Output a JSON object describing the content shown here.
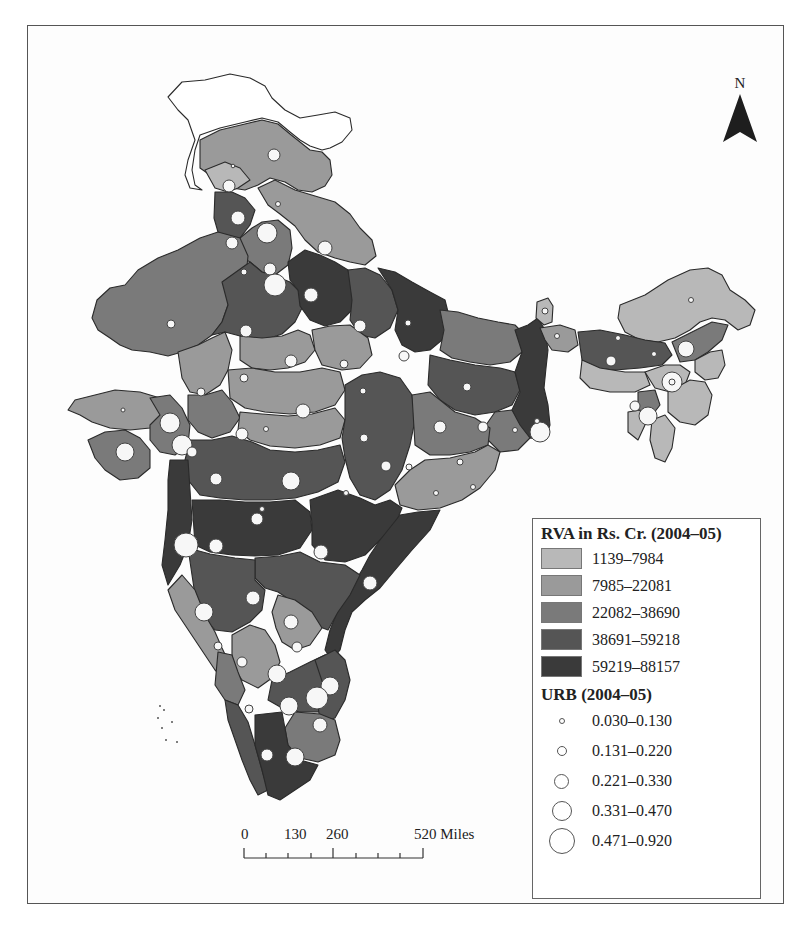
{
  "map": {
    "type": "choropleth-with-proportional-symbols",
    "region": "India (states and regions)",
    "north_arrow": {
      "label": "N",
      "icon": "north-arrow-icon"
    },
    "scale_bar": {
      "labels": [
        "0",
        "130",
        "260",
        "520 Miles"
      ],
      "ticks_miles": [
        0,
        65,
        130,
        195,
        260,
        325,
        390,
        455,
        520
      ],
      "unit": "Miles"
    },
    "legend": {
      "choropleth": {
        "title": "RVA in Rs. Cr. (2004–05)",
        "classes": [
          {
            "label": "1139–7984",
            "color": "#b8b8b8"
          },
          {
            "label": "7985–22081",
            "color": "#9a9a9a"
          },
          {
            "label": "22082–38690",
            "color": "#7a7a7a"
          },
          {
            "label": "38691–59218",
            "color": "#555555"
          },
          {
            "label": "59219–88157",
            "color": "#3a3a3a"
          }
        ],
        "no_data_color": "#ffffff"
      },
      "symbols": {
        "title": "URB (2004–05)",
        "classes": [
          {
            "label": "0.030–0.130",
            "diameter": 6
          },
          {
            "label": "0.131–0.220",
            "diameter": 10
          },
          {
            "label": "0.221–0.330",
            "diameter": 15
          },
          {
            "label": "0.331–0.470",
            "diameter": 20
          },
          {
            "label": "0.471–0.920",
            "diameter": 26
          }
        ]
      }
    }
  }
}
